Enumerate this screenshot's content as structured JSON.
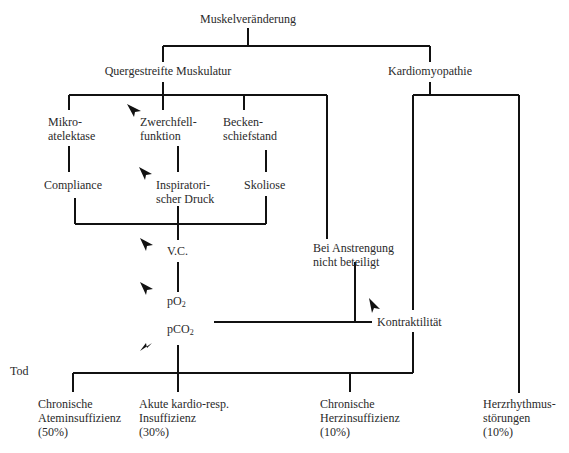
{
  "diagram": {
    "root": "Muskelveränderung",
    "branches": {
      "skeletal": "Quergestreifte Muskulatur",
      "cardiac": "Kardiomyopathie"
    },
    "skeletal_children": {
      "mikroatelektase": [
        "Mikro-",
        "atelektase"
      ],
      "zwerchfell": [
        "Zwerchfell-",
        "funktion"
      ],
      "becken": [
        "Becken-",
        "schiefstand"
      ]
    },
    "second_row": {
      "compliance": "Compliance",
      "inspiratorisch": [
        "Inspiratori-",
        "scher Druck"
      ],
      "skoliose": "Skoliose"
    },
    "chain": {
      "vc": "V.C.",
      "po2_base": "pO",
      "po2_sub": "2",
      "pco2_base": "pCO",
      "pco2_sub": "2"
    },
    "exertion": [
      "Bei Anstrengung",
      "nicht beteiligt"
    ],
    "kontraktilitaet": "Kontraktilität",
    "death_label": "Tod",
    "outcomes": [
      {
        "line1": "Chronische",
        "line2": "Ateminsuffizienz",
        "pct": "(50%)"
      },
      {
        "line1": "Akute kardio-resp.",
        "line2": "Insuffizienz",
        "pct": "(30%)"
      },
      {
        "line1": "Chronische",
        "line2": "Herzinsuffizienz",
        "pct": "(10%)"
      },
      {
        "line1": "Herzrhythmus-",
        "line2": "störungen",
        "pct": "(10%)"
      }
    ],
    "arrow_markers": [
      "down-arrow-zwerchfell",
      "down-arrow-inspiratorisch",
      "down-arrow-vc",
      "down-arrow-po2",
      "up-arrow-pco2",
      "down-arrow-kontraktilitaet"
    ],
    "colors": {
      "line": "#111111",
      "text": "#2a2a2a",
      "background": "#ffffff"
    }
  }
}
